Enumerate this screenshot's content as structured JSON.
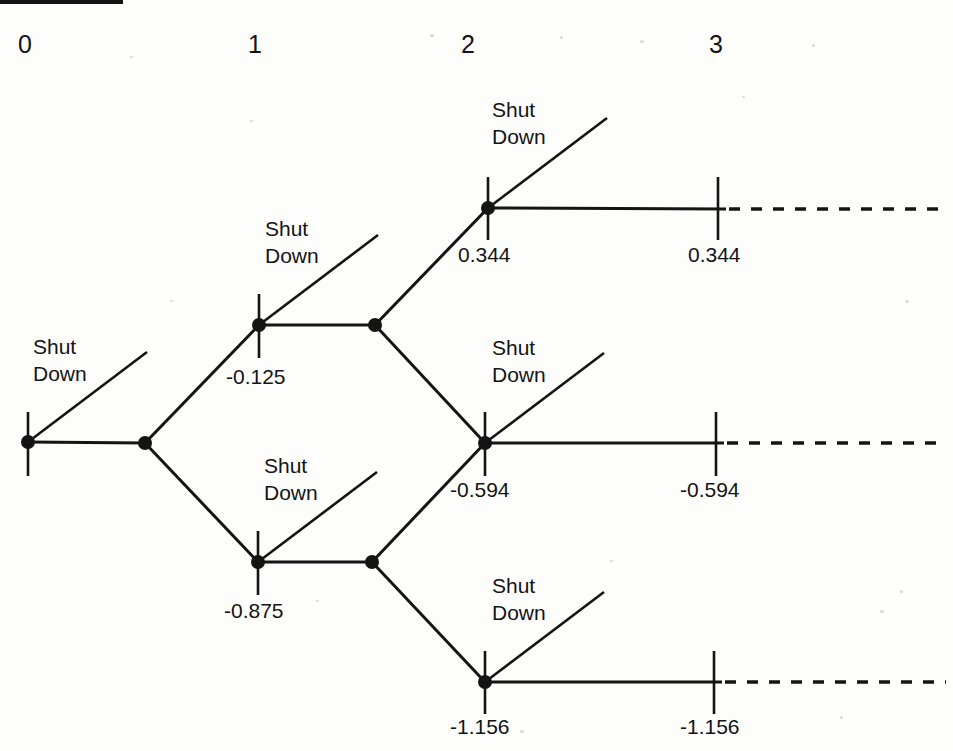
{
  "figure": {
    "type": "binomial-decision-tree",
    "top_rule": {
      "x": 0,
      "y": 2,
      "width": 123
    },
    "period_labels": [
      {
        "text": "0",
        "x": 18,
        "y": 32
      },
      {
        "text": "1",
        "x": 248,
        "y": 32
      },
      {
        "text": "2",
        "x": 461,
        "y": 32
      },
      {
        "text": "3",
        "x": 709,
        "y": 32
      }
    ],
    "option_label_lines": [
      "Shut",
      "Down"
    ],
    "shutdown_labels": [
      {
        "id": "shutdown-root",
        "x": 33,
        "y": 333
      },
      {
        "id": "shutdown-period1-up",
        "x": 265,
        "y": 215
      },
      {
        "id": "shutdown-period1-down",
        "x": 264,
        "y": 452
      },
      {
        "id": "shutdown-period2-up",
        "x": 492,
        "y": 96
      },
      {
        "id": "shutdown-period2-mid",
        "x": 492,
        "y": 334
      },
      {
        "id": "shutdown-period2-down",
        "x": 492,
        "y": 572
      }
    ],
    "node_values": [
      {
        "id": "value-period1-up",
        "text": "-0.125",
        "x": 226,
        "y": 366
      },
      {
        "id": "value-period1-down",
        "text": "-0.875",
        "x": 224,
        "y": 600
      },
      {
        "id": "value-period2-up",
        "text": "0.344",
        "x": 458,
        "y": 244
      },
      {
        "id": "value-period2-mid",
        "text": "-0.594",
        "x": 450,
        "y": 479
      },
      {
        "id": "value-period2-down",
        "text": "-1.156",
        "x": 450,
        "y": 716
      },
      {
        "id": "value-period3-up",
        "text": "0.344",
        "x": 688,
        "y": 244
      },
      {
        "id": "value-period3-mid",
        "text": "-0.594",
        "x": 680,
        "y": 479
      },
      {
        "id": "value-period3-down",
        "text": "-1.156",
        "x": 680,
        "y": 716
      }
    ],
    "nodes": [
      {
        "id": "node-root",
        "x": 28,
        "y": 442,
        "dot": true,
        "tick": true,
        "tick_top": 412,
        "tick_bottom": 476
      },
      {
        "id": "node-branch-0",
        "x": 145,
        "y": 443,
        "dot": true,
        "tick": false
      },
      {
        "id": "node-period1-up",
        "x": 259,
        "y": 325,
        "dot": true,
        "tick": true,
        "tick_top": 294,
        "tick_bottom": 358
      },
      {
        "id": "node-period1-down",
        "x": 258,
        "y": 562,
        "dot": true,
        "tick": true,
        "tick_top": 531,
        "tick_bottom": 595
      },
      {
        "id": "node-branch-1-up",
        "x": 375,
        "y": 325,
        "dot": true,
        "tick": false
      },
      {
        "id": "node-branch-1-down",
        "x": 372,
        "y": 562,
        "dot": true,
        "tick": false
      },
      {
        "id": "node-period2-up",
        "x": 488,
        "y": 208,
        "dot": true,
        "tick": true,
        "tick_top": 177,
        "tick_bottom": 240
      },
      {
        "id": "node-period2-mid",
        "x": 485,
        "y": 443,
        "dot": true,
        "tick": true,
        "tick_top": 412,
        "tick_bottom": 476
      },
      {
        "id": "node-period2-down",
        "x": 485,
        "y": 682,
        "dot": true,
        "tick": true,
        "tick_top": 651,
        "tick_bottom": 714
      },
      {
        "id": "node-period3-up",
        "x": 718,
        "y": 209,
        "dot": false,
        "tick": true,
        "tick_top": 177,
        "tick_bottom": 240
      },
      {
        "id": "node-period3-mid",
        "x": 716,
        "y": 443,
        "dot": false,
        "tick": true,
        "tick_top": 412,
        "tick_bottom": 476
      },
      {
        "id": "node-period3-down",
        "x": 714,
        "y": 682,
        "dot": false,
        "tick": true,
        "tick_top": 651,
        "tick_bottom": 714
      }
    ],
    "solid_edges": [
      {
        "id": "edge-root-to-branch0",
        "x1": 28,
        "y1": 442,
        "x2": 145,
        "y2": 443
      },
      {
        "id": "edge-branch0-up",
        "x1": 145,
        "y1": 443,
        "x2": 259,
        "y2": 325
      },
      {
        "id": "edge-branch0-down",
        "x1": 145,
        "y1": 443,
        "x2": 258,
        "y2": 562
      },
      {
        "id": "edge-period1up-to-branch",
        "x1": 259,
        "y1": 325,
        "x2": 375,
        "y2": 325
      },
      {
        "id": "edge-period1down-to-branch",
        "x1": 258,
        "y1": 562,
        "x2": 372,
        "y2": 562
      },
      {
        "id": "edge-branch1up-up",
        "x1": 375,
        "y1": 325,
        "x2": 488,
        "y2": 208
      },
      {
        "id": "edge-branch1up-down",
        "x1": 375,
        "y1": 325,
        "x2": 485,
        "y2": 443
      },
      {
        "id": "edge-branch1down-up",
        "x1": 372,
        "y1": 562,
        "x2": 485,
        "y2": 443
      },
      {
        "id": "edge-branch1down-down",
        "x1": 372,
        "y1": 562,
        "x2": 485,
        "y2": 682
      },
      {
        "id": "edge-period2up-to-period3",
        "x1": 488,
        "y1": 208,
        "x2": 726,
        "y2": 209
      },
      {
        "id": "edge-period2mid-to-period3",
        "x1": 485,
        "y1": 443,
        "x2": 724,
        "y2": 443
      },
      {
        "id": "edge-period2down-to-period3",
        "x1": 485,
        "y1": 682,
        "x2": 722,
        "y2": 682
      }
    ],
    "shutdown_edges": [
      {
        "id": "shutdown-edge-root",
        "x1": 28,
        "y1": 442,
        "x2": 147,
        "y2": 352
      },
      {
        "id": "shutdown-edge-period1-up",
        "x1": 259,
        "y1": 325,
        "x2": 378,
        "y2": 235
      },
      {
        "id": "shutdown-edge-period1-down",
        "x1": 258,
        "y1": 562,
        "x2": 377,
        "y2": 472
      },
      {
        "id": "shutdown-edge-period2-up",
        "x1": 488,
        "y1": 208,
        "x2": 607,
        "y2": 118
      },
      {
        "id": "shutdown-edge-period2-mid",
        "x1": 485,
        "y1": 443,
        "x2": 604,
        "y2": 353
      },
      {
        "id": "shutdown-edge-period2-down",
        "x1": 485,
        "y1": 682,
        "x2": 604,
        "y2": 592
      }
    ],
    "dashed_edges": [
      {
        "id": "dashed-edge-up",
        "x1": 729,
        "y1": 209,
        "x2": 946,
        "y2": 209
      },
      {
        "id": "dashed-edge-mid",
        "x1": 727,
        "y1": 443,
        "x2": 946,
        "y2": 443
      },
      {
        "id": "dashed-edge-down",
        "x1": 725,
        "y1": 682,
        "x2": 946,
        "y2": 682
      }
    ],
    "colors": {
      "ink": "#141414",
      "background": "#fdfdfc",
      "speck": "#d8d8d4"
    }
  },
  "chart_data": {
    "type": "diagram",
    "title": "",
    "periods": [
      "0",
      "1",
      "2",
      "3"
    ],
    "decision_label": "Shut Down",
    "lattice_values": {
      "period_1": [
        "-0.125",
        "-0.875"
      ],
      "period_2": [
        "0.344",
        "-0.594",
        "-1.156"
      ],
      "period_3": [
        "0.344",
        "-0.594",
        "-1.156"
      ]
    }
  }
}
